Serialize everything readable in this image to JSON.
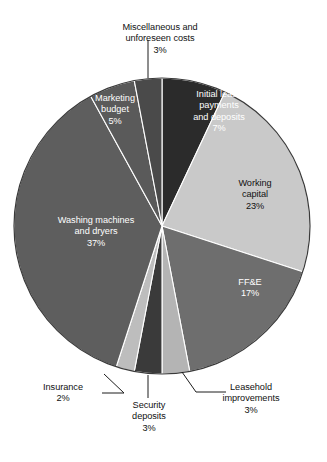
{
  "chart_data": {
    "type": "pie",
    "title": "",
    "subtitle": "",
    "xlabel": "",
    "ylabel": "",
    "legend_position": "none",
    "grid": false,
    "value_unit": "percent",
    "categories": [
      "Initial lease payments and deposits",
      "Working capital",
      "FF&E",
      "Leasehold improvements",
      "Security deposits",
      "Insurance",
      "Washing machines and dryers",
      "Marketing budget",
      "Miscellaneous and unforeseen costs"
    ],
    "values": [
      7,
      23,
      17,
      3,
      3,
      2,
      37,
      5,
      3
    ],
    "slices": [
      {
        "name": "initial-lease-payments-and-deposits",
        "label_line1": "Initial lease",
        "label_line2": "payments",
        "label_line3": "and deposits",
        "percent_text": "7%",
        "value": 7,
        "color": "#2b2b2b",
        "text_on": "dark",
        "label_style": "inside"
      },
      {
        "name": "working-capital",
        "label_line1": "Working",
        "label_line2": "capital",
        "label_line3": "",
        "percent_text": "23%",
        "value": 23,
        "color": "#c9c9c9",
        "text_on": "light",
        "label_style": "inside"
      },
      {
        "name": "ff-and-e",
        "label_line1": "FF&E",
        "label_line2": "",
        "label_line3": "",
        "percent_text": "17%",
        "value": 17,
        "color": "#6e6e6e",
        "text_on": "light",
        "label_style": "inside"
      },
      {
        "name": "leasehold-improvements",
        "label_line1": "Leasehold",
        "label_line2": "improvements",
        "label_line3": "",
        "percent_text": "3%",
        "value": 3,
        "color": "#b4b4b4",
        "text_on": "dark",
        "label_style": "callout"
      },
      {
        "name": "security-deposits",
        "label_line1": "Security",
        "label_line2": "deposits",
        "label_line3": "",
        "percent_text": "3%",
        "value": 3,
        "color": "#3a3a3a",
        "text_on": "dark",
        "label_style": "callout"
      },
      {
        "name": "insurance",
        "label_line1": "Insurance",
        "label_line2": "",
        "label_line3": "",
        "percent_text": "2%",
        "value": 2,
        "color": "#bdbdbd",
        "text_on": "dark",
        "label_style": "callout"
      },
      {
        "name": "washing-machines-and-dryers",
        "label_line1": "Washing machines",
        "label_line2": "and dryers",
        "label_line3": "",
        "percent_text": "37%",
        "value": 37,
        "color": "#5e5e5e",
        "text_on": "dark",
        "label_style": "inside"
      },
      {
        "name": "marketing-budget",
        "label_line1": "Marketing",
        "label_line2": "budget",
        "label_line3": "",
        "percent_text": "5%",
        "value": 5,
        "color": "#5a5a5a",
        "text_on": "dark",
        "label_style": "inside"
      },
      {
        "name": "miscellaneous-and-unforeseen-costs",
        "label_line1": "Miscellaneous and",
        "label_line2": "unforeseen costs",
        "label_line3": "",
        "percent_text": "3%",
        "value": 3,
        "color": "#4a4a4a",
        "text_on": "dark",
        "label_style": "callout"
      }
    ],
    "geometry": {
      "center_x": 162,
      "center_y": 226,
      "radius": 148,
      "start_angle_deg": 0,
      "direction": "clockwise"
    },
    "colors": {
      "background": "#ffffff",
      "outline": "#3a3a3a",
      "leader_line": "#1c1c1c",
      "text_dark": "#111111",
      "text_light": "#ffffff"
    }
  }
}
